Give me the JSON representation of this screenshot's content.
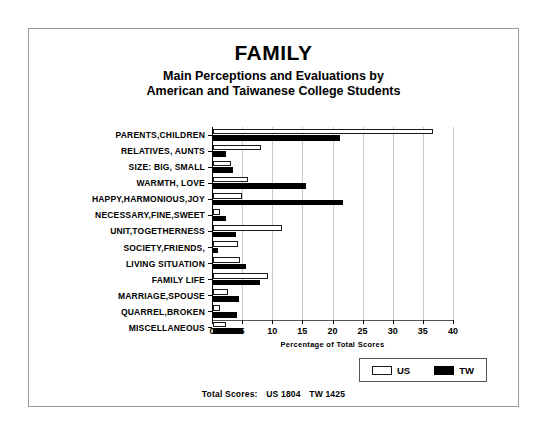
{
  "chart_data": {
    "type": "bar",
    "orientation": "horizontal",
    "title": "FAMILY",
    "subtitle_line1": "Main Perceptions and Evaluations by",
    "subtitle_line2": "American and Taiwanese College Students",
    "xlabel": "Percentage of Total Scores",
    "ylabel": "",
    "xlim": [
      0,
      40
    ],
    "xticks": [
      0,
      5,
      10,
      15,
      20,
      25,
      30,
      35,
      40
    ],
    "grid": true,
    "legend_position": "bottom-right",
    "categories": [
      "PARENTS,CHILDREN",
      "RELATIVES, AUNTS",
      "SIZE: BIG, SMALL",
      "WARMTH, LOVE",
      "HAPPY,HARMONIOUS,JOY",
      "NECESSARY,FINE,SWEET",
      "UNIT,TOGETHERNESS",
      "SOCIETY,FRIENDS,",
      "LIVING SITUATION",
      "FAMILY LIFE",
      "MARRIAGE,SPOUSE",
      "QUARREL,BROKEN",
      "MISCELLANEOUS"
    ],
    "series": [
      {
        "name": "US",
        "color": "#ffffff",
        "values": [
          36.5,
          8.0,
          3.0,
          5.8,
          4.8,
          1.2,
          11.5,
          4.2,
          4.5,
          9.2,
          2.5,
          1.2,
          2.2
        ]
      },
      {
        "name": "TW",
        "color": "#000000",
        "values": [
          21.0,
          2.2,
          3.3,
          15.5,
          21.5,
          2.2,
          3.8,
          0.8,
          5.5,
          7.8,
          4.3,
          4.0,
          5.0
        ]
      }
    ],
    "annotations": {
      "totals_prefix": "Total Scores:",
      "total_us": "US 1804",
      "total_tw": "TW 1425"
    }
  }
}
